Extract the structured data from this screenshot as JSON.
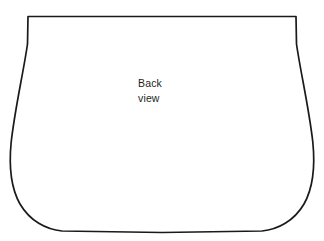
{
  "canvas": {
    "width": 324,
    "height": 241,
    "background_color": "#ffffff"
  },
  "pattern": {
    "name": "bag-back-panel-outline",
    "shape_description": "flared bag panel outline with flat top edge, outward-curving sides and rounded bottom corners",
    "stroke_color": "#1a1a1a",
    "stroke_width": 1.7,
    "fill_color": "#ffffff",
    "geometry": {
      "top_left": [
        28,
        16.5
      ],
      "top_right": [
        296,
        16.5
      ],
      "leftmost_point": [
        10.5,
        158
      ],
      "rightmost_point": [
        313.5,
        163
      ],
      "bottom_left": [
        62,
        231
      ],
      "bottom_right": [
        262,
        231
      ],
      "bottom_mid": [
        162,
        232.5
      ]
    },
    "path": "M 28 16.5 L 296 16.5 L 296.5 44 C 300.5 72 309 108 312.8 142 C 314.6 160 314.2 186 304 204 C 294 221 278 229.5 262 231 L 162 232.5 L 62 231 C 46 229.5 30 221 20 204 C 9.8 186 9.4 160 11.2 142 C 15 108 23.5 72 27.5 44 Z"
  },
  "label": {
    "name": "back-view-label",
    "lines": [
      "Back",
      "view"
    ],
    "text_color": "#231f20",
    "font_size_px": 10.5,
    "position": {
      "x": 138,
      "y": 76
    },
    "alignment": "left"
  }
}
